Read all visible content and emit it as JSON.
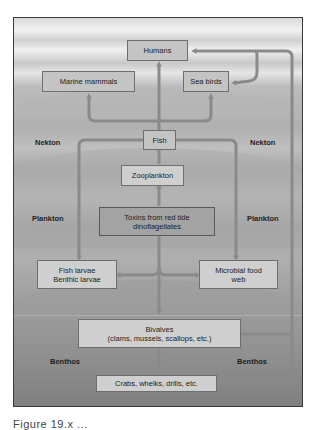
{
  "diagram": {
    "nodes": {
      "humans": "Humans",
      "marine_mammals": "Marine mammals",
      "sea_birds": "Sea birds",
      "fish": "Fish",
      "zooplankton": "Zooplankton",
      "toxins_line1": "Toxins from red tide",
      "toxins_line2": "dinoflagellates",
      "fish_larvae_line1": "Fish larvae",
      "fish_larvae_line2": "Benthic larvae",
      "microbial_line1": "Microbial food",
      "microbial_line2": "web",
      "bivalves_line1": "Bivalves",
      "bivalves_line2": "(clams, mussels, scallops, etc.)",
      "crabs": "Crabs, whelks, drills, etc."
    },
    "zones": {
      "nekton_left": "Nekton",
      "nekton_right": "Nekton",
      "plankton_left": "Plankton",
      "plankton_right": "Plankton",
      "benthos_left": "Benthos",
      "benthos_right": "Benthos"
    },
    "colors": {
      "arrow": "#8a8a8a",
      "box_fill": "#c4c4c4",
      "toxin_box_fill": "#a3a3a3",
      "box_border": "#6e6e6e"
    },
    "caption": "Figure 19.x ..."
  }
}
